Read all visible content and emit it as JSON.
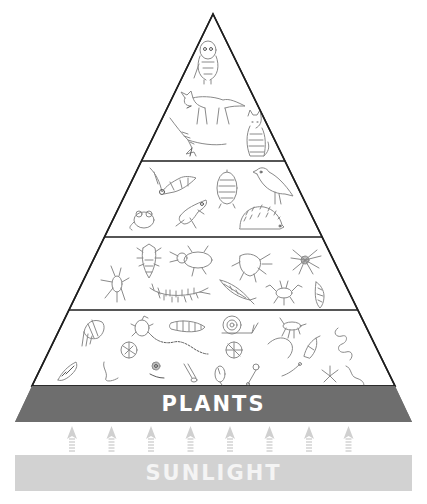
{
  "levels": [
    {
      "id": "apex-predators",
      "organisms": [
        "owl",
        "fox",
        "hawk",
        "cat"
      ]
    },
    {
      "id": "vertebrate-consumers",
      "organisms": [
        "bat",
        "mole",
        "songbird",
        "mouse",
        "frog",
        "hedgehog"
      ]
    },
    {
      "id": "predatory-invertebrates",
      "organisms": [
        "beetle-larva",
        "ground-beetle",
        "weevil",
        "spider",
        "harvestman",
        "centipede",
        "lacewing",
        "pseudoscorpion",
        "rove-beetle"
      ]
    },
    {
      "id": "decomposers-and-micro-organisms",
      "organisms": [
        "woodlouse",
        "mite",
        "millipede",
        "snail",
        "springtail",
        "cocoon",
        "earthworm",
        "nematode",
        "rotifer",
        "amoeba",
        "flagellate",
        "tardigrade",
        "larva",
        "worm",
        "ciliate",
        "spore",
        "bacterium",
        "fungal-hypha",
        "protozoan",
        "roundworm"
      ]
    }
  ],
  "base": {
    "plants_label": "PLANTS",
    "sunlight_label": "SUNLIGHT",
    "arrow_count": 8
  },
  "colors": {
    "outline": "#1e1e1e",
    "plants": "#6e6e6e",
    "sunlight": "#d2d2d2",
    "arrows": "#d0d0d0",
    "sketch": "#8a8a8a"
  }
}
